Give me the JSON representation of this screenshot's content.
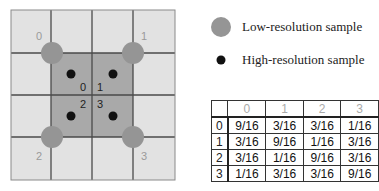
{
  "legend": {
    "low_res_label": "Low-resolution sample",
    "high_res_label": "High-resolution sample",
    "low_res_icon": "gray-circle-icon",
    "high_res_icon": "black-dot-icon"
  },
  "grid": {
    "low_res_labels": [
      "0",
      "1",
      "2",
      "3"
    ],
    "high_res_labels": [
      "0",
      "1",
      "2",
      "3"
    ]
  },
  "colors": {
    "grid_bg": "#e2e2e2",
    "center_bg": "#a9a9a9",
    "low_res_sample": "#959595",
    "high_res_sample": "#111111",
    "grid_line": "#4a4a4a",
    "outer_label": "#9a9a9a"
  },
  "table": {
    "column_headers": [
      "0",
      "1",
      "2",
      "3"
    ],
    "rows": [
      {
        "header": "0",
        "values": [
          "9/16",
          "3/16",
          "3/16",
          "1/16"
        ]
      },
      {
        "header": "1",
        "values": [
          "3/16",
          "9/16",
          "1/16",
          "3/16"
        ]
      },
      {
        "header": "2",
        "values": [
          "3/16",
          "1/16",
          "9/16",
          "3/16"
        ]
      },
      {
        "header": "3",
        "values": [
          "1/16",
          "3/16",
          "3/16",
          "9/16"
        ]
      }
    ]
  }
}
